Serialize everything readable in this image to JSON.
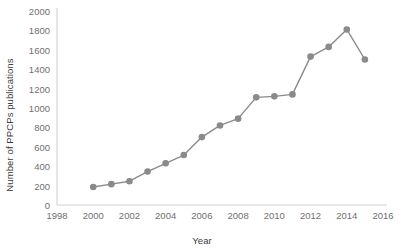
{
  "chart_data": {
    "type": "line",
    "title": "",
    "subtitle": "",
    "xlabel": "Year",
    "ylabel": "Number of PPCPs publications",
    "xlim": [
      1998,
      2016
    ],
    "ylim": [
      0,
      2000
    ],
    "xticks": [
      1998,
      2000,
      2002,
      2004,
      2006,
      2008,
      2010,
      2012,
      2014,
      2016
    ],
    "yticks": [
      0,
      200,
      400,
      600,
      800,
      1000,
      1200,
      1400,
      1600,
      1800,
      2000
    ],
    "grid": false,
    "legend": null,
    "marker": "circle",
    "series_color": "#8a8a8a",
    "x": [
      2000,
      2001,
      2002,
      2003,
      2004,
      2005,
      2006,
      2007,
      2008,
      2009,
      2010,
      2011,
      2012,
      2013,
      2014,
      2015
    ],
    "values": [
      185,
      215,
      245,
      345,
      430,
      515,
      700,
      820,
      890,
      1110,
      1120,
      1140,
      1530,
      1630,
      1810,
      1500
    ],
    "series": [
      {
        "name": "Number of PPCPs publications",
        "values": [
          185,
          215,
          245,
          345,
          430,
          515,
          700,
          820,
          890,
          1110,
          1120,
          1140,
          1530,
          1630,
          1810,
          1500
        ]
      }
    ],
    "annotations": []
  },
  "axes": {
    "x_title": "Year",
    "y_title": "Number of PPCPs publications",
    "x_tick_labels": [
      "1998",
      "2000",
      "2002",
      "2004",
      "2006",
      "2008",
      "2010",
      "2012",
      "2014",
      "2016"
    ],
    "y_tick_labels": [
      "0",
      "200",
      "400",
      "600",
      "800",
      "1000",
      "1200",
      "1400",
      "1600",
      "1800",
      "2000"
    ]
  },
  "colors": {
    "series": "#8a8a8a",
    "axis": "#cfcfcf",
    "tick_text": "#6f6f6f",
    "title_text": "#3a3a3a",
    "background": "#ffffff"
  }
}
